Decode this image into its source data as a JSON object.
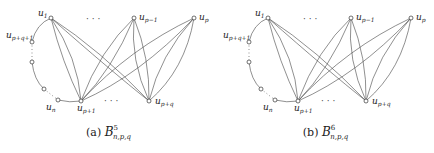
{
  "figures": [
    {
      "id": "a",
      "caption_prefix": "(a)",
      "symbol": "B",
      "superscript": "5",
      "subscript": "n,p,q",
      "offset_x": 0
    },
    {
      "id": "b",
      "caption_prefix": "(b)",
      "symbol": "B",
      "superscript": "6",
      "subscript": "n,p,q",
      "offset_x": 217
    }
  ],
  "nodes": [
    {
      "key": "u1",
      "label": "u",
      "sub": "1",
      "x": 51,
      "y": 18
    },
    {
      "key": "up-1",
      "label": "u",
      "sub": "p−1",
      "x": 134,
      "y": 18
    },
    {
      "key": "up",
      "label": "u",
      "sub": "p",
      "x": 194,
      "y": 18
    },
    {
      "key": "up+q+1",
      "label": "u",
      "sub": "p+q+1",
      "x": 32,
      "y": 42
    },
    {
      "key": "mid1",
      "label": "",
      "sub": "",
      "x": 32,
      "y": 62
    },
    {
      "key": "mid2",
      "label": "",
      "sub": "",
      "x": 44,
      "y": 89
    },
    {
      "key": "un",
      "label": "u",
      "sub": "n",
      "x": 58,
      "y": 100
    },
    {
      "key": "up+1",
      "label": "u",
      "sub": "p+1",
      "x": 81,
      "y": 101
    },
    {
      "key": "up+q",
      "label": "u",
      "sub": "p+q",
      "x": 149,
      "y": 101
    }
  ],
  "ellipses": {
    "top": "· · ·",
    "bottom": "· · ·"
  }
}
